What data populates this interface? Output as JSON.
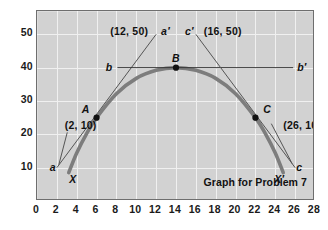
{
  "chart_data": {
    "type": "line",
    "title": "Graph for Problem 7",
    "xlabel": "",
    "ylabel": "",
    "xlim": [
      0,
      28
    ],
    "ylim": [
      0,
      57
    ],
    "grid": true,
    "legend": "none",
    "x_ticks": [
      0,
      2,
      4,
      6,
      8,
      10,
      12,
      14,
      16,
      18,
      20,
      22,
      24,
      26,
      28
    ],
    "y_ticks": [
      10,
      20,
      30,
      40,
      50
    ],
    "series": [
      {
        "name": "parabola XX'",
        "type": "curve",
        "color": "#7d7d7d",
        "width": 3.6,
        "points": [
          {
            "x": 3.2,
            "y": 8.5
          },
          {
            "x": 4,
            "y": 14.4
          },
          {
            "x": 5,
            "y": 20.2
          },
          {
            "x": 6,
            "y": 25.0
          },
          {
            "x": 8,
            "y": 32.2
          },
          {
            "x": 10,
            "y": 36.8
          },
          {
            "x": 12,
            "y": 39.2
          },
          {
            "x": 14,
            "y": 40.0
          },
          {
            "x": 16,
            "y": 39.2
          },
          {
            "x": 18,
            "y": 36.8
          },
          {
            "x": 20,
            "y": 32.2
          },
          {
            "x": 22,
            "y": 25.0
          },
          {
            "x": 23,
            "y": 20.2
          },
          {
            "x": 24,
            "y": 14.4
          },
          {
            "x": 24.8,
            "y": 8.5
          }
        ]
      },
      {
        "name": "secant a-a'",
        "type": "segment",
        "color": "#555555",
        "from": {
          "x": 2,
          "y": 10
        },
        "to": {
          "x": 12,
          "y": 50
        }
      },
      {
        "name": "tangent b-b'",
        "type": "segment",
        "color": "#333333",
        "from": {
          "x": 8.1,
          "y": 40
        },
        "to": {
          "x": 25.8,
          "y": 40
        }
      },
      {
        "name": "secant c-c'",
        "type": "segment",
        "color": "#555555",
        "from": {
          "x": 26,
          "y": 10
        },
        "to": {
          "x": 16,
          "y": 50
        }
      },
      {
        "name": "leader (2,10)",
        "type": "segment",
        "color": "#555555",
        "from": {
          "x": 3.05,
          "y": 20.6
        },
        "to": {
          "x": 2.2,
          "y": 10.9
        }
      },
      {
        "name": "leader (26,10)",
        "type": "segment",
        "color": "#555555",
        "from": {
          "x": 23.6,
          "y": 23.2
        },
        "to": {
          "x": 25.7,
          "y": 11.2
        }
      }
    ],
    "points": [
      {
        "label": "A",
        "x": 6,
        "y": 25
      },
      {
        "label": "B",
        "x": 14,
        "y": 40
      },
      {
        "label": "C",
        "x": 22,
        "y": 25
      }
    ],
    "annotations": [
      {
        "name": "coord-12-50",
        "text": "(12, 50)",
        "x": 12,
        "y": 50
      },
      {
        "name": "label-a-prime",
        "text": "a′",
        "x": 12.5,
        "y": 50
      },
      {
        "name": "label-c-prime",
        "text": "c′",
        "x": 15.5,
        "y": 50
      },
      {
        "name": "coord-16-50",
        "text": "(16, 50)",
        "x": 16,
        "y": 50
      },
      {
        "name": "label-B",
        "text": "B",
        "x": 14,
        "y": 42.5
      },
      {
        "name": "label-b",
        "text": "b",
        "x": 7.4,
        "y": 40
      },
      {
        "name": "label-b-prime",
        "text": "b′",
        "x": 26.2,
        "y": 40
      },
      {
        "name": "label-A",
        "text": "A",
        "x": 5.3,
        "y": 27
      },
      {
        "name": "label-C",
        "text": "C",
        "x": 22.8,
        "y": 27
      },
      {
        "name": "coord-2-10",
        "text": "(2, 10)",
        "x": 2.8,
        "y": 22.5
      },
      {
        "name": "coord-26-10",
        "text": "(26, 10)",
        "x": 24.8,
        "y": 22.5
      },
      {
        "name": "label-a",
        "text": "a",
        "x": 1.9,
        "y": 10
      },
      {
        "name": "label-c",
        "text": "c",
        "x": 26.1,
        "y": 10
      },
      {
        "name": "label-X",
        "text": "X",
        "x": 3.6,
        "y": 6.4
      },
      {
        "name": "label-X-prime",
        "text": "X′",
        "x": 24.4,
        "y": 6.4
      },
      {
        "name": "caption",
        "text": "Graph for Problem 7",
        "x": 21.5,
        "y": 2.6
      }
    ],
    "colors": {
      "plot_background": "#d2d2d2",
      "grid": "#f0f0f0",
      "frame": "#6e6e6e",
      "curve": "#7d7d7d",
      "secant": "#555555",
      "text": "#111111",
      "page_background": "#ffffff"
    }
  }
}
